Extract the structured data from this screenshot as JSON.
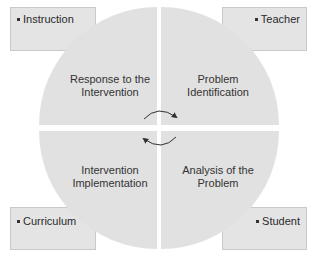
{
  "diagram": {
    "type": "cycle-quadrant-diagram",
    "colors": {
      "circle_fill": "#e1e1e1",
      "box_fill": "#e4e4e4",
      "box_border": "#c9c9c9",
      "text": "#2a2a2a",
      "arrow": "#333333",
      "background": "#ffffff"
    },
    "quadrants": [
      {
        "position": "top-left",
        "line1": "Response to the",
        "line2": "Intervention"
      },
      {
        "position": "top-right",
        "line1": "Problem",
        "line2": "Identification"
      },
      {
        "position": "bottom-left",
        "line1": "Intervention",
        "line2": "Implementation"
      },
      {
        "position": "bottom-right",
        "line1": "Analysis of the",
        "line2": "Problem"
      }
    ],
    "corner_boxes": [
      {
        "position": "top-left",
        "label": "Instruction"
      },
      {
        "position": "top-right",
        "label": "Teacher"
      },
      {
        "position": "bottom-left",
        "label": "Curriculum"
      },
      {
        "position": "bottom-right",
        "label": "Student"
      }
    ],
    "center_icon": "clockwise-cycle-arrows-icon"
  }
}
